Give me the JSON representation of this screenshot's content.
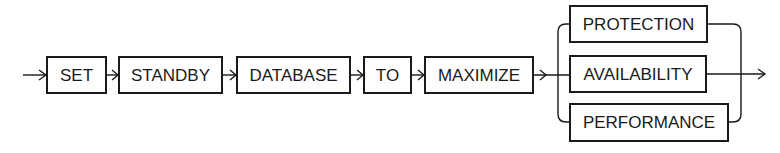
{
  "diagram": {
    "type": "railroad-syntax",
    "sequence": [
      {
        "label": "SET",
        "x": 47,
        "w": 59
      },
      {
        "label": "STANDBY",
        "x": 119,
        "w": 103
      },
      {
        "label": "DATABASE",
        "x": 237,
        "w": 113
      },
      {
        "label": "TO",
        "x": 364,
        "w": 47
      },
      {
        "label": "MAXIMIZE",
        "x": 425,
        "w": 108
      }
    ],
    "choices": [
      {
        "label": "PROTECTION",
        "x": 570,
        "w": 137,
        "y": 6
      },
      {
        "label": "AVAILABILITY",
        "x": 570,
        "w": 136,
        "y": 56
      },
      {
        "label": "PERFORMANCE",
        "x": 570,
        "w": 158,
        "y": 104
      }
    ],
    "main_y": 75,
    "box_h": 36,
    "colors": {
      "stroke": "#1a1a1a",
      "background": "#ffffff"
    }
  }
}
